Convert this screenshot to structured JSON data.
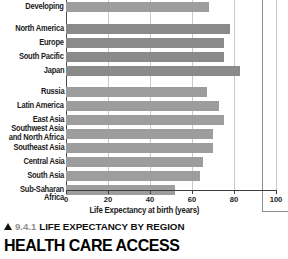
{
  "figure": {
    "caption_marker": "triangle-up",
    "caption_number": "9.4.1",
    "caption_title": "LIFE EXPECTANCY BY REGION"
  },
  "section": {
    "heading": "HEALTH CARE ACCESS"
  },
  "colors": {
    "bar_default": "#9d9d9d",
    "bar_developed": "#8a8a8a",
    "gridline": "#c9c9c9",
    "axis": "#3d3d3d",
    "text": "#1b1b1b",
    "caption_number": "#8f8f8f"
  },
  "chart_data": {
    "type": "bar",
    "orientation": "horizontal",
    "title": "LIFE EXPECTANCY BY REGION",
    "xlabel": "Life Expectancy at birth (years)",
    "ylabel": "",
    "xlim": [
      0,
      100
    ],
    "xticks": [
      0,
      20,
      40,
      60,
      80,
      100
    ],
    "xtick_labels": [
      "0",
      "20",
      "40",
      "60",
      "80",
      "100"
    ],
    "grid": "vertical",
    "legend": "none",
    "note": "Top bar 'Developing' is cropped by the top edge of the screenshot.",
    "categories": [
      "Developing",
      "North America",
      "Europe",
      "South Pacific",
      "Japan",
      "Russia",
      "Latin America",
      "East Asia",
      "Southwest Asia\nand North Africa",
      "Southeast Asia",
      "Central Asia",
      "South Asia",
      "Sub-Saharan Africa"
    ],
    "values": [
      68,
      78,
      75,
      75,
      83,
      67,
      73,
      75,
      70,
      70,
      65,
      64,
      52
    ],
    "series": [
      {
        "name": "Life Expectancy at birth (years)",
        "values": [
          68,
          78,
          75,
          75,
          83,
          67,
          73,
          75,
          70,
          70,
          65,
          64,
          52
        ]
      }
    ],
    "groups": [
      {
        "name": "Developing",
        "categories": [
          "Developing"
        ]
      },
      {
        "name": "Developed regions",
        "categories": [
          "North America",
          "Europe",
          "South Pacific",
          "Japan"
        ]
      },
      {
        "name": "Other regions",
        "categories": [
          "Russia",
          "Latin America",
          "East Asia",
          "Southwest Asia and North Africa",
          "Southeast Asia",
          "Central Asia",
          "South Asia",
          "Sub-Saharan Africa"
        ]
      }
    ]
  }
}
